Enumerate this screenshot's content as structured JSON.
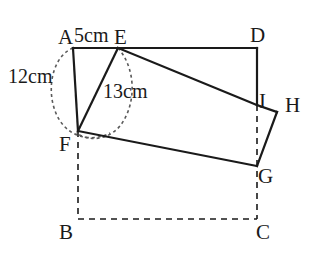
{
  "figure": {
    "stroke_color": "#1a1a1a",
    "dash_color": "#5a5a5a",
    "background": "#ffffff",
    "solid_width": 2.2,
    "dashed_width": 1.6
  },
  "vertices": [
    {
      "id": "A",
      "label": "A",
      "x": 73,
      "y": 48,
      "label_x": 58,
      "label_y": 27
    },
    {
      "id": "E",
      "label": "E",
      "x": 118,
      "y": 48,
      "label_x": 114,
      "label_y": 27
    },
    {
      "id": "D",
      "label": "D",
      "x": 257,
      "y": 48,
      "label_x": 250,
      "label_y": 25
    },
    {
      "id": "I",
      "label": "I",
      "x": 257,
      "y": 105,
      "label_x": 259,
      "label_y": 91
    },
    {
      "id": "H",
      "label": "H",
      "x": 277,
      "y": 112,
      "label_x": 285,
      "label_y": 95
    },
    {
      "id": "F",
      "label": "F",
      "x": 78,
      "y": 131,
      "label_x": 59,
      "label_y": 134
    },
    {
      "id": "G",
      "label": "G",
      "x": 257,
      "y": 166,
      "label_x": 258,
      "label_y": 166
    },
    {
      "id": "B",
      "label": "B",
      "x": 78,
      "y": 219,
      "label_x": 59,
      "label_y": 222
    },
    {
      "id": "C",
      "label": "C",
      "x": 257,
      "y": 219,
      "label_x": 256,
      "label_y": 222
    }
  ],
  "measurements": [
    {
      "id": "AE",
      "text": "5cm",
      "x": 74,
      "y": 25
    },
    {
      "id": "AF",
      "text": "12cm",
      "x": 8,
      "y": 66
    },
    {
      "id": "EF",
      "text": "13cm",
      "x": 103,
      "y": 81
    }
  ],
  "solid_edges": [
    {
      "id": "A-E",
      "from": "A",
      "to": "E"
    },
    {
      "id": "E-D",
      "from": "E",
      "to": "D"
    },
    {
      "id": "D-I",
      "from": "D",
      "to": "I"
    },
    {
      "id": "A-F",
      "from": "A",
      "to": "F"
    },
    {
      "id": "E-F",
      "from": "E",
      "to": "F"
    },
    {
      "id": "E-I",
      "from": "E",
      "to": "I"
    },
    {
      "id": "I-H",
      "from": "I",
      "to": "H"
    },
    {
      "id": "H-G",
      "from": "H",
      "to": "G"
    },
    {
      "id": "F-G",
      "from": "F",
      "to": "G"
    }
  ],
  "dashed_edges": [
    {
      "id": "F-B",
      "from": "F",
      "to": "B"
    },
    {
      "id": "B-C",
      "from": "B",
      "to": "C"
    },
    {
      "id": "I-C",
      "from": "I",
      "to": "C"
    }
  ],
  "arcs": [
    {
      "id": "arc-radius-12-from-A",
      "d": "M 73 48 C 48 58 44 104 64 126 C 76 139 95 141 110 133"
    },
    {
      "id": "arc-radius-13-from-E",
      "d": "M 118 48 C 136 68 137 104 120 126 C 108 140 90 142 76 133"
    }
  ]
}
